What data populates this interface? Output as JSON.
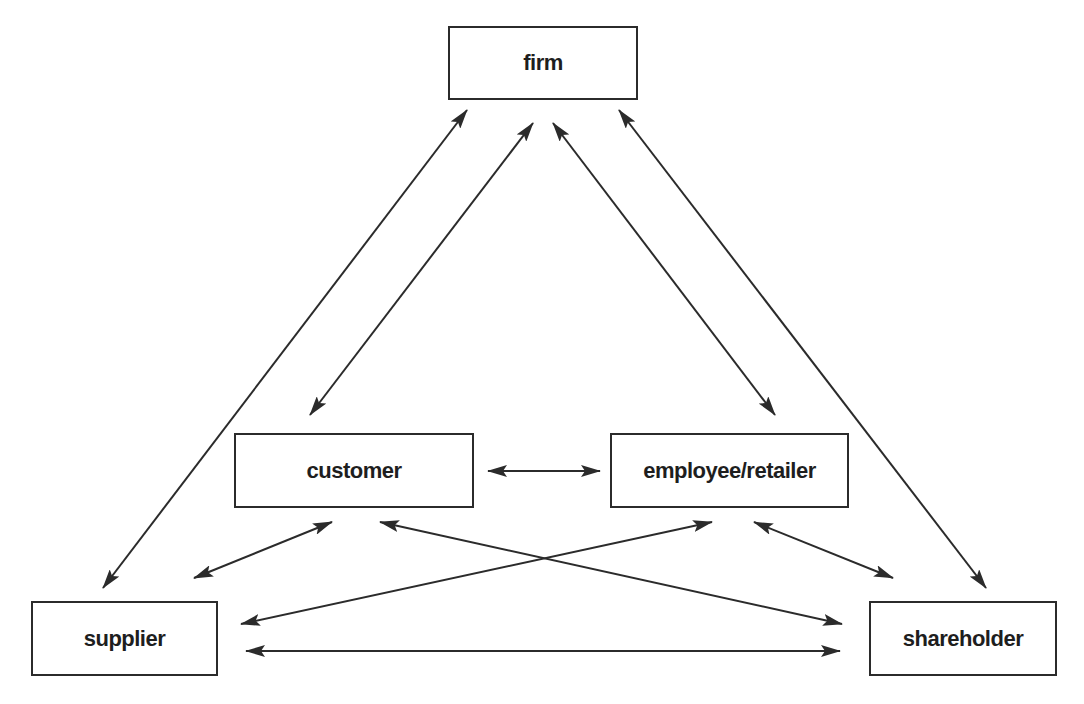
{
  "diagram": {
    "type": "stakeholder-relationship",
    "colors": {
      "stroke": "#2b2b2b",
      "text": "#1e1e1e",
      "background": "#ffffff"
    },
    "nodes": {
      "firm": {
        "label": "firm"
      },
      "customer": {
        "label": "customer"
      },
      "employee_retailer": {
        "label": "employee/retailer"
      },
      "supplier": {
        "label": "supplier"
      },
      "shareholder": {
        "label": "shareholder"
      }
    },
    "edges": [
      {
        "from": "firm",
        "to": "supplier",
        "direction": "both"
      },
      {
        "from": "firm",
        "to": "customer",
        "direction": "both"
      },
      {
        "from": "firm",
        "to": "employee/retailer",
        "direction": "both"
      },
      {
        "from": "firm",
        "to": "shareholder",
        "direction": "both"
      },
      {
        "from": "customer",
        "to": "employee/retailer",
        "direction": "both"
      },
      {
        "from": "customer",
        "to": "supplier",
        "direction": "both"
      },
      {
        "from": "customer",
        "to": "shareholder",
        "direction": "both"
      },
      {
        "from": "employee/retailer",
        "to": "supplier",
        "direction": "both"
      },
      {
        "from": "employee/retailer",
        "to": "shareholder",
        "direction": "both"
      },
      {
        "from": "supplier",
        "to": "shareholder",
        "direction": "both"
      }
    ]
  }
}
